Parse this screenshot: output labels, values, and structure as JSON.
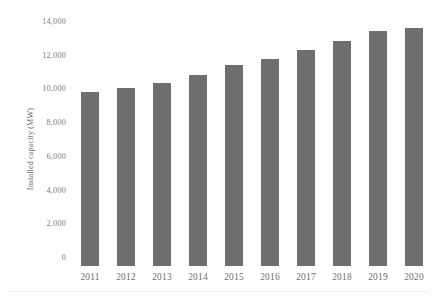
{
  "chart_data": {
    "type": "bar",
    "title": "",
    "subtitle": "",
    "xlabel": "",
    "ylabel": "Installed capacity (MW)",
    "categories": [
      "2011",
      "2012",
      "2013",
      "2014",
      "2015",
      "2016",
      "2017",
      "2018",
      "2019",
      "2020"
    ],
    "values": [
      10300,
      10550,
      10850,
      11350,
      11900,
      12250,
      12800,
      13350,
      13950,
      14100
    ],
    "series": [
      {
        "name": "Installed capacity",
        "values": [
          10300,
          10550,
          10850,
          11350,
          11900,
          12250,
          12800,
          13350,
          13950,
          14100
        ]
      }
    ],
    "ylim": [
      0,
      14700
    ],
    "ytick_values": [
      0,
      2000,
      4000,
      6000,
      8000,
      10000,
      12000,
      14000
    ],
    "ytick_labels": [
      "0",
      "2,000",
      "4,000",
      "6,000",
      "8,000",
      "10,000",
      "12,000",
      "14,000"
    ],
    "xtick_labels": [
      "2011",
      "2012",
      "2013",
      "2014",
      "2015",
      "2016",
      "2017",
      "2018",
      "2019",
      "2020"
    ],
    "grid": false,
    "legend": false,
    "legend_position": "none",
    "bar_color": "#6e6e6e",
    "text_color": "#7b7b7b",
    "background_color": "#fdfdfd",
    "annotations": []
  }
}
